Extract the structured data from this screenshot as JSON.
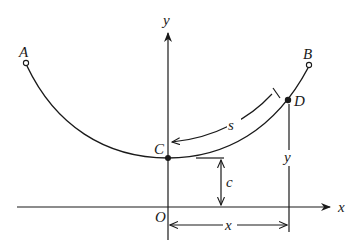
{
  "figure": {
    "type": "catenary-diagram",
    "labels": {
      "A": "A",
      "B": "B",
      "C": "C",
      "D": "D",
      "O": "O",
      "x_axis": "x",
      "y_axis": "y",
      "s": "s",
      "c": "c",
      "x_dim": "x",
      "y_dim": "y"
    },
    "points": {
      "A": {
        "x": 26,
        "y": 62,
        "marker": "open-circle"
      },
      "B": {
        "x": 309,
        "y": 64,
        "marker": "open-circle"
      },
      "C": {
        "x": 168,
        "y": 158,
        "marker": "filled-dot"
      },
      "D": {
        "x": 288,
        "y": 100,
        "marker": "filled-dot"
      },
      "O": {
        "x": 168,
        "y": 207
      }
    },
    "colors": {
      "ink": "#1a1a1a",
      "background": "#ffffff"
    }
  }
}
